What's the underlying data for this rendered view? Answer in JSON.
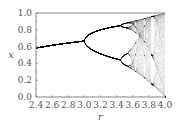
{
  "chart_data": {
    "type": "scatter",
    "title": "",
    "subtitle": "Bifurcation diagram of the logistic map x_{n+1} = r x_n (1 - x_n)",
    "xlabel": "r",
    "ylabel": "x",
    "xlim": [
      2.4,
      4.0
    ],
    "ylim": [
      0.0,
      1.0
    ],
    "xticks": [
      2.4,
      2.6,
      2.8,
      3.0,
      3.2,
      3.4,
      3.6,
      3.8,
      4.0
    ],
    "xtick_labels": [
      "2.4",
      "2.6",
      "2.8",
      "3.0",
      "3.2",
      "3.4",
      "3.6",
      "3.8",
      "4.0"
    ],
    "yticks": [
      0.0,
      0.2,
      0.4,
      0.6,
      0.8,
      1.0
    ],
    "ytick_labels": [
      "0.0",
      "0.2",
      "0.4",
      "0.6",
      "0.8",
      "1.0"
    ],
    "grid": false,
    "legend": null,
    "annotations": [
      {
        "feature": "period-doubling bifurcation",
        "r": 3.0,
        "x": 0.667
      },
      {
        "feature": "second period doubling",
        "r": 3.449
      },
      {
        "feature": "onset of chaos",
        "r": 3.57
      },
      {
        "feature": "period-3 window (white gap)",
        "r": 3.83
      }
    ],
    "series": [
      {
        "name": "logistic map attractor",
        "r_start": 2.4,
        "r_end": 4.0,
        "r_samples": 520,
        "transient_iterations": 300,
        "plotted_iterations": 160,
        "x0": 0.5,
        "color": "#000000",
        "point_opacity": 0.1
      }
    ],
    "sample_points": [
      {
        "r": 2.4,
        "x": [
          0.583
        ]
      },
      {
        "r": 2.8,
        "x": [
          0.643
        ]
      },
      {
        "r": 3.0,
        "x": [
          0.667
        ]
      },
      {
        "r": 3.2,
        "x": [
          0.513,
          0.799
        ]
      },
      {
        "r": 3.5,
        "x": [
          0.383,
          0.501,
          0.827,
          0.875
        ]
      },
      {
        "r": 4.0,
        "x_range": [
          0.0,
          1.0
        ]
      }
    ]
  },
  "style": {
    "axis_color": "#888888",
    "text_color": "#555555",
    "point_color": "#000000"
  }
}
